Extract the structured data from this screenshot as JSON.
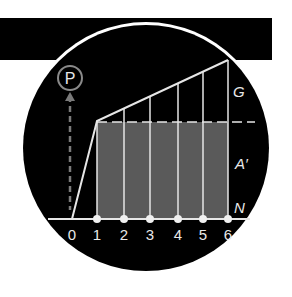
{
  "diagram": {
    "colors": {
      "background": "#ffffff",
      "disc": "#000000",
      "band": "#000000",
      "ring": "#ffffff",
      "area_fill": "#5a5a5a",
      "lines": "#e6e6e6",
      "p_symbol": "#8a8a8a"
    },
    "p_symbol": {
      "label": "P"
    },
    "labels": {
      "top": "G",
      "middle": "A′",
      "bottom": "N"
    },
    "x_ticks": [
      "0",
      "1",
      "2",
      "3",
      "4",
      "5",
      "6"
    ]
  }
}
